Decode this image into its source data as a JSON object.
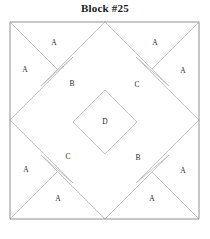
{
  "title": "Block #25",
  "block": {
    "name": "quilt-block-diagram",
    "frame": {
      "x": 10,
      "y": 22,
      "width": 189,
      "height": 197
    },
    "colors": {
      "background": "#ffffff",
      "outer_border": "#8f8f8f",
      "piece_line": "#b5b5b5",
      "label_text": "#2b2b2b",
      "title_text": "#1a1a1a"
    },
    "patches": [
      {
        "id": "A1",
        "label": "A",
        "x": 54,
        "y": 43
      },
      {
        "id": "A2",
        "label": "A",
        "x": 155,
        "y": 43
      },
      {
        "id": "A3",
        "label": "A",
        "x": 25,
        "y": 70
      },
      {
        "id": "A4",
        "label": "A",
        "x": 183,
        "y": 71
      },
      {
        "id": "B1",
        "label": "B",
        "x": 72,
        "y": 84
      },
      {
        "id": "C1",
        "label": "C",
        "x": 137,
        "y": 85
      },
      {
        "id": "D",
        "label": "D",
        "x": 105,
        "y": 122
      },
      {
        "id": "C2",
        "label": "C",
        "x": 68,
        "y": 157
      },
      {
        "id": "B2",
        "label": "B",
        "x": 138,
        "y": 158
      },
      {
        "id": "A5",
        "label": "A",
        "x": 26,
        "y": 170
      },
      {
        "id": "A6",
        "label": "A",
        "x": 183,
        "y": 171
      },
      {
        "id": "A7",
        "label": "A",
        "x": 58,
        "y": 199
      },
      {
        "id": "A8",
        "label": "A",
        "x": 152,
        "y": 199
      }
    ],
    "outline": {
      "points": "10,22 199,22 199,219 10,219"
    },
    "seams": [
      {
        "name": "diamond-top-left-edge",
        "x1": 73,
        "y1": 122,
        "x2": 105,
        "y2": 90
      },
      {
        "name": "diamond-top-right-edge",
        "x1": 105,
        "y1": 90,
        "x2": 137,
        "y2": 122
      },
      {
        "name": "diamond-bottom-right-edge",
        "x1": 137,
        "y1": 122,
        "x2": 105,
        "y2": 154
      },
      {
        "name": "diamond-bottom-left-edge",
        "x1": 105,
        "y1": 154,
        "x2": 73,
        "y2": 122
      },
      {
        "name": "corner-nw-diagonal",
        "x1": 10,
        "y1": 22,
        "x2": 57,
        "y2": 69
      },
      {
        "name": "corner-ne-diagonal",
        "x1": 199,
        "y1": 22,
        "x2": 152,
        "y2": 69
      },
      {
        "name": "corner-sw-diagonal",
        "x1": 10,
        "y1": 219,
        "x2": 57,
        "y2": 172
      },
      {
        "name": "corner-se-diagonal",
        "x1": 199,
        "y1": 219,
        "x2": 152,
        "y2": 172
      },
      {
        "name": "edge-top-left-fan",
        "x1": 105,
        "y1": 22,
        "x2": 41,
        "y2": 86
      },
      {
        "name": "edge-top-right-fan",
        "x1": 105,
        "y1": 22,
        "x2": 169,
        "y2": 86
      },
      {
        "name": "edge-left-top-fan",
        "x1": 10,
        "y1": 120,
        "x2": 73,
        "y2": 57
      },
      {
        "name": "edge-left-bottom-fan",
        "x1": 10,
        "y1": 120,
        "x2": 73,
        "y2": 183
      },
      {
        "name": "edge-right-top-fan",
        "x1": 199,
        "y1": 120,
        "x2": 136,
        "y2": 57
      },
      {
        "name": "edge-right-bottom-fan",
        "x1": 199,
        "y1": 120,
        "x2": 136,
        "y2": 183
      },
      {
        "name": "edge-bottom-left-fan",
        "x1": 105,
        "y1": 219,
        "x2": 41,
        "y2": 155
      },
      {
        "name": "edge-bottom-right-fan",
        "x1": 105,
        "y1": 219,
        "x2": 169,
        "y2": 155
      },
      {
        "name": "rect-b1-outer",
        "x1": 41,
        "y1": 86,
        "x2": 73,
        "y2": 57
      },
      {
        "name": "rect-c1-outer",
        "x1": 169,
        "y1": 86,
        "x2": 136,
        "y2": 57
      },
      {
        "name": "rect-c2-outer",
        "x1": 41,
        "y1": 155,
        "x2": 73,
        "y2": 183
      },
      {
        "name": "rect-b2-outer",
        "x1": 169,
        "y1": 155,
        "x2": 136,
        "y2": 183
      }
    ]
  }
}
